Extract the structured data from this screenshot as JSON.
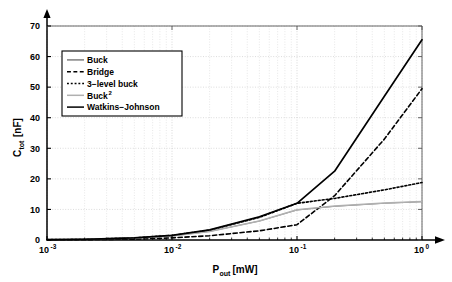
{
  "chart_data": {
    "type": "line",
    "title": "",
    "xlabel": "P_out[mW]",
    "xlabel_main": "P",
    "xlabel_sub": "out",
    "xlabel_unit": "[mW]",
    "ylabel": "C_tot[nF]",
    "ylabel_main": "C",
    "ylabel_sub": "tot",
    "ylabel_unit": "[nF]",
    "xscale": "log",
    "yscale": "linear",
    "xlim": [
      0.001,
      1.0
    ],
    "ylim": [
      0,
      70
    ],
    "xtick_labels": [
      "10^-3",
      "10^-2",
      "10^-1",
      "10^0"
    ],
    "xtick_mantissas": [
      "10",
      "10",
      "10",
      "10"
    ],
    "xtick_exponents": [
      "-3",
      "-2",
      "-1",
      "0"
    ],
    "xtick_values": [
      0.001,
      0.01,
      0.1,
      1.0
    ],
    "ytick_labels": [
      "0",
      "10",
      "20",
      "30",
      "40",
      "50",
      "60",
      "70"
    ],
    "ytick_values": [
      0,
      10,
      20,
      30,
      40,
      50,
      60,
      70
    ],
    "grid": true,
    "grid_minor": true,
    "legend_position": "upper-left",
    "series": [
      {
        "name": "Buck",
        "style": "solid",
        "color": "#808080",
        "width": 1.0,
        "x": [
          0.001,
          0.002,
          0.005,
          0.01,
          0.02,
          0.05,
          0.1,
          0.2,
          0.5,
          1.0
        ],
        "values": [
          0.1,
          0.2,
          0.6,
          1.3,
          2.8,
          6.2,
          9.8,
          11.0,
          12.0,
          12.5
        ]
      },
      {
        "name": "Bridge",
        "style": "dashed",
        "color": "#000000",
        "width": 1.6,
        "x": [
          0.001,
          0.002,
          0.005,
          0.01,
          0.02,
          0.05,
          0.1,
          0.2,
          0.5,
          1.0
        ],
        "values": [
          0.05,
          0.1,
          0.3,
          0.7,
          1.4,
          3.0,
          5.0,
          14.5,
          33.0,
          49.5
        ]
      },
      {
        "name": "3-level buck",
        "style": "dotted",
        "color": "#000000",
        "width": 1.6,
        "x": [
          0.001,
          0.002,
          0.005,
          0.01,
          0.02,
          0.05,
          0.1,
          0.2,
          0.5,
          1.0
        ],
        "values": [
          0.1,
          0.25,
          0.7,
          1.5,
          3.2,
          7.4,
          12.0,
          13.6,
          16.4,
          18.8
        ]
      },
      {
        "name": "Buck 2",
        "style": "solid",
        "color": "#b0b0b0",
        "width": 1.6,
        "x": [
          0.001,
          0.002,
          0.005,
          0.01,
          0.02,
          0.05,
          0.1,
          0.2,
          0.5,
          1.0
        ],
        "values": [
          0.1,
          0.2,
          0.6,
          1.3,
          2.8,
          6.2,
          9.9,
          11.1,
          12.1,
          12.6
        ]
      },
      {
        "name": "Watkins-Johnson",
        "style": "solid",
        "color": "#000000",
        "width": 1.7,
        "x": [
          0.001,
          0.002,
          0.005,
          0.01,
          0.02,
          0.05,
          0.1,
          0.2,
          0.5,
          1.0
        ],
        "values": [
          0.1,
          0.25,
          0.7,
          1.5,
          3.3,
          7.6,
          12.0,
          22.5,
          47.0,
          65.5
        ]
      }
    ],
    "legend_entries": [
      {
        "label": "Buck",
        "style": "solid",
        "color": "#808080",
        "sup": ""
      },
      {
        "label": "Bridge",
        "style": "dashed",
        "color": "#000000",
        "sup": ""
      },
      {
        "label": "3−level buck",
        "style": "dotted",
        "color": "#000000",
        "sup": ""
      },
      {
        "label": "Buck",
        "style": "solid",
        "color": "#b0b0b0",
        "sup": "2"
      },
      {
        "label": "Watkins−Johnson",
        "style": "solid",
        "color": "#000000",
        "sup": ""
      }
    ]
  }
}
